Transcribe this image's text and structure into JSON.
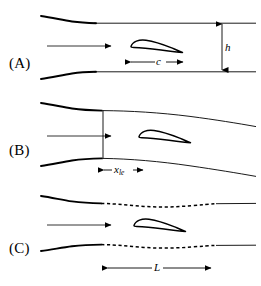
{
  "figure": {
    "width": 261,
    "height": 286,
    "background_color": "#ffffff",
    "line_color": "#000000"
  },
  "panels": [
    {
      "id": "A",
      "label": "(A)",
      "label_x": 9,
      "label_y": 63,
      "wall_type": "straight-parallel-solid",
      "flow_arrow": {
        "x1": 47,
        "y1": 46,
        "x2": 113,
        "y2": 46
      },
      "airfoil": {
        "x": 128,
        "y": 38,
        "chord_px": 52
      },
      "dimensions": [
        {
          "name": "h",
          "label": "h",
          "subscript": "",
          "orientation": "vertical",
          "x": 222,
          "y1": 22,
          "y2": 72,
          "label_x": 227,
          "label_y": 40
        },
        {
          "name": "c",
          "label": "c",
          "subscript": "",
          "orientation": "horizontal",
          "y": 62,
          "x1": 130,
          "x2": 180,
          "label_x": 152,
          "label_y": 55
        }
      ]
    },
    {
      "id": "B",
      "label": "(B)",
      "label_x": 9,
      "label_y": 150,
      "wall_type": "diverging-solid",
      "flow_arrow": {
        "x1": 47,
        "y1": 136,
        "x2": 113,
        "y2": 136
      },
      "airfoil": {
        "x": 136,
        "y": 128,
        "chord_px": 52
      },
      "throat_line": {
        "x": 103,
        "y1": 110,
        "y2": 160
      },
      "dimensions": [
        {
          "name": "x_le",
          "label": "x",
          "subscript": "le",
          "orientation": "horizontal",
          "y": 170,
          "x1": 104,
          "x2": 143,
          "label_x": 114,
          "label_y": 163
        }
      ]
    },
    {
      "id": "C",
      "label": "(C)",
      "label_x": 9,
      "label_y": 248,
      "wall_type": "partially-dashed-adaptive",
      "flow_arrow": {
        "x1": 47,
        "y1": 225,
        "x2": 113,
        "y2": 225
      },
      "airfoil": {
        "x": 131,
        "y": 217,
        "chord_px": 52
      },
      "dimensions": [
        {
          "name": "L",
          "label": "L",
          "subscript": "",
          "orientation": "horizontal",
          "y": 268,
          "x1": 107,
          "x2": 212,
          "label_x": 156,
          "label_y": 261
        }
      ]
    }
  ],
  "labels": {
    "panel_a": "(A)",
    "panel_b": "(B)",
    "panel_c": "(C)",
    "height_symbol": "h",
    "chord_symbol": "c",
    "leading_edge_symbol": "x",
    "leading_edge_subscript": "le",
    "length_symbol": "L"
  }
}
